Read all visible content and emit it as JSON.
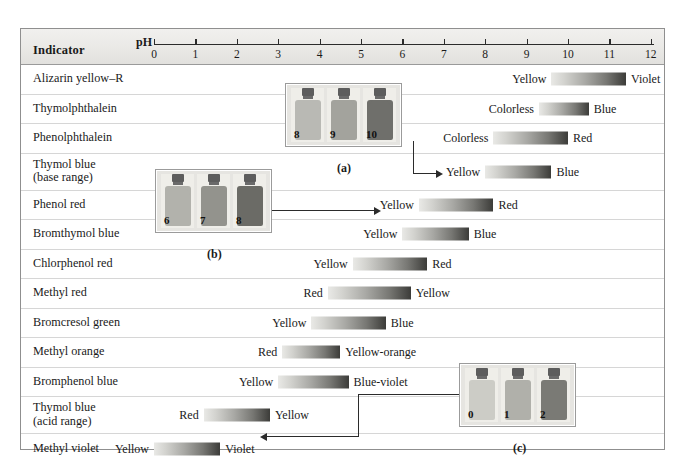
{
  "figure": {
    "header": {
      "indicator_column_label": "Indicator",
      "ph_label": "pH"
    },
    "axis": {
      "ticks": [
        "0",
        "1",
        "2",
        "3",
        "4",
        "5",
        "6",
        "7",
        "8",
        "9",
        "10",
        "11",
        "12"
      ],
      "min": 0,
      "max": 12
    }
  },
  "chart_data": {
    "type": "bar",
    "xlabel": "pH",
    "ylabel": "Indicator",
    "xlim": [
      0,
      12
    ],
    "grid": false,
    "legend": "none",
    "categories": [
      "Alizarin yellow–R",
      "Thymolphthalein",
      "Phenolphthalein",
      "Thymol blue\n(base range)",
      "Phenol red",
      "Bromthymol blue",
      "Chlorphenol red",
      "Methyl red",
      "Bromcresol green",
      "Methyl orange",
      "Bromphenol blue",
      "Thymol blue\n(acid range)",
      "Methyl violet"
    ],
    "rows": [
      {
        "indicator": "Alizarin yellow–R",
        "acid_color": "Yellow",
        "base_color": "Violet",
        "ph_low": 9.6,
        "ph_high": 11.4
      },
      {
        "indicator": "Thymolphthalein",
        "acid_color": "Colorless",
        "base_color": "Blue",
        "ph_low": 9.3,
        "ph_high": 10.5
      },
      {
        "indicator": "Phenolphthalein",
        "acid_color": "Colorless",
        "base_color": "Red",
        "ph_low": 8.2,
        "ph_high": 10.0
      },
      {
        "indicator": "Thymol blue\n(base range)",
        "acid_color": "Yellow",
        "base_color": "Blue",
        "ph_low": 8.0,
        "ph_high": 9.6
      },
      {
        "indicator": "Phenol red",
        "acid_color": "Yellow",
        "base_color": "Red",
        "ph_low": 6.4,
        "ph_high": 8.2
      },
      {
        "indicator": "Bromthymol blue",
        "acid_color": "Yellow",
        "base_color": "Blue",
        "ph_low": 6.0,
        "ph_high": 7.6
      },
      {
        "indicator": "Chlorphenol red",
        "acid_color": "Yellow",
        "base_color": "Red",
        "ph_low": 4.8,
        "ph_high": 6.6
      },
      {
        "indicator": "Methyl red",
        "acid_color": "Red",
        "base_color": "Yellow",
        "ph_low": 4.2,
        "ph_high": 6.2
      },
      {
        "indicator": "Bromcresol green",
        "acid_color": "Yellow",
        "base_color": "Blue",
        "ph_low": 3.8,
        "ph_high": 5.6
      },
      {
        "indicator": "Methyl orange",
        "acid_color": "Red",
        "base_color": "Yellow-orange",
        "ph_low": 3.1,
        "ph_high": 4.5
      },
      {
        "indicator": "Bromphenol blue",
        "acid_color": "Yellow",
        "base_color": "Blue-violet",
        "ph_low": 3.0,
        "ph_high": 4.7
      },
      {
        "indicator": "Thymol blue\n(acid range)",
        "acid_color": "Red",
        "base_color": "Yellow",
        "ph_low": 1.2,
        "ph_high": 2.8
      },
      {
        "indicator": "Methyl violet",
        "acid_color": "Yellow",
        "base_color": "Violet",
        "ph_low": 0.0,
        "ph_high": 1.6
      }
    ]
  },
  "insets": [
    {
      "id": "a",
      "caption": "(a)",
      "bottles": [
        {
          "number": "8",
          "shade": "#b9b9b4"
        },
        {
          "number": "9",
          "shade": "#a3a39d"
        },
        {
          "number": "10",
          "shade": "#6f6f6b"
        }
      ],
      "points_to": "Thymol blue (base range)"
    },
    {
      "id": "b",
      "caption": "(b)",
      "bottles": [
        {
          "number": "6",
          "shade": "#b2b2ac"
        },
        {
          "number": "7",
          "shade": "#93938d"
        },
        {
          "number": "8",
          "shade": "#6b6b66"
        }
      ],
      "points_to": "Phenol red"
    },
    {
      "id": "c",
      "caption": "(c)",
      "bottles": [
        {
          "number": "0",
          "shade": "#ccccc6"
        },
        {
          "number": "1",
          "shade": "#b0b0aa"
        },
        {
          "number": "2",
          "shade": "#7a7a75"
        }
      ],
      "points_to": "Methyl violet"
    }
  ]
}
